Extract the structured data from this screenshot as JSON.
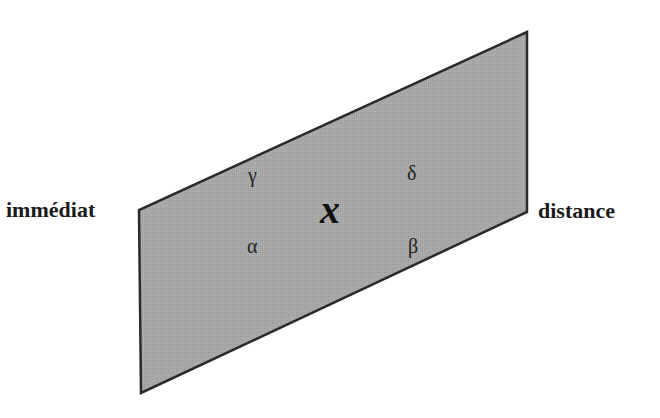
{
  "diagram": {
    "plane": {
      "fill": "#a6a6a6",
      "stroke": "#2a2a2a",
      "points": "527,32 527,212 141,393 139,210"
    },
    "left_label": "immédiat",
    "right_label": "distance",
    "center_variable": "x",
    "quadrants": {
      "top_left": "γ",
      "top_right": "δ",
      "bottom_left": "α",
      "bottom_right": "β"
    }
  }
}
